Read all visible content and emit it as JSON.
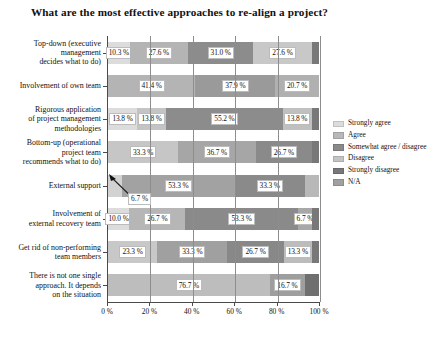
{
  "chart_data": {
    "type": "bar",
    "subtype": "stacked-horizontal-100",
    "title": "What are the most effective approaches to re-align a project?",
    "xlabel": "",
    "ylabel": "",
    "xlim": [
      0,
      100
    ],
    "grid": true,
    "legend_position": "right",
    "xticks": [
      "0 %",
      "20 %",
      "40 %",
      "60 %",
      "80 %",
      "100 %"
    ],
    "xtick_values": [
      0,
      20,
      40,
      60,
      80,
      100
    ],
    "categories": [
      "Top-down (executive management decides what to do)",
      "Involvement of own team",
      "Rigorous application of project management methodologies",
      "Bottom-up (operational project team recommends what to do)",
      "External support",
      "Involvement of external recovery team",
      "Get rid of non-performing team members",
      "There is not one single approach. It depends on the situation"
    ],
    "series": [
      {
        "name": "Strongly agree",
        "color": "#dcdcdc",
        "values": [
          10.3,
          41.4,
          13.8,
          33.3,
          6.7,
          10.0,
          23.3,
          76.7
        ]
      },
      {
        "name": "Agree",
        "color": "#b4b4b4",
        "values": [
          27.6,
          37.9,
          13.8,
          36.7,
          53.3,
          26.7,
          33.3,
          0
        ]
      },
      {
        "name": "Somewhat agree / disagree",
        "color": "#8c8c8c",
        "values": [
          31.0,
          20.7,
          55.2,
          26.7,
          33.3,
          53.3,
          26.7,
          16.7
        ]
      },
      {
        "name": "Disagree",
        "color": "#c8c8c8",
        "values": [
          27.6,
          0,
          13.8,
          0,
          0,
          6.7,
          13.3,
          0
        ]
      },
      {
        "name": "Strongly disagree",
        "color": "#787878",
        "values": [
          3.5,
          0,
          3.4,
          3.3,
          6.7,
          3.3,
          3.4,
          6.6
        ]
      },
      {
        "name": "N/A",
        "color": "#a0a0a0",
        "values": [
          0,
          0,
          0,
          0,
          0,
          0,
          0,
          0
        ]
      }
    ],
    "rows": [
      {
        "category_lines": [
          "Top-down (executive",
          "management",
          "decides what to do)"
        ],
        "segments": [
          {
            "series": "Strongly agree",
            "value": 10.3,
            "label": "10.3 %",
            "color": "#dcdcdc",
            "show_label": true
          },
          {
            "series": "Agree",
            "value": 27.6,
            "label": "27.6 %",
            "color": "#b4b4b4",
            "show_label": true
          },
          {
            "series": "Somewhat agree / disagree",
            "value": 31.0,
            "label": "31.0 %",
            "color": "#8c8c8c",
            "show_label": true
          },
          {
            "series": "Disagree",
            "value": 27.6,
            "label": "27.6 %",
            "color": "#c8c8c8",
            "show_label": true
          },
          {
            "series": "Strongly disagree",
            "value": 3.5,
            "label": "",
            "color": "#787878",
            "show_label": false
          }
        ]
      },
      {
        "category_lines": [
          "Involvement of own team"
        ],
        "segments": [
          {
            "series": "Strongly agree",
            "value": 41.4,
            "label": "41.4 %",
            "color": "#b4b4b4",
            "show_label": true
          },
          {
            "series": "Agree",
            "value": 37.9,
            "label": "37.9 %",
            "color": "#9a9a9a",
            "show_label": true
          },
          {
            "series": "Somewhat agree / disagree",
            "value": 20.7,
            "label": "20.7 %",
            "color": "#b0b0b0",
            "show_label": true
          }
        ]
      },
      {
        "category_lines": [
          "Rigorous application",
          "of project management",
          "methodologies"
        ],
        "segments": [
          {
            "series": "Strongly agree",
            "value": 13.8,
            "label": "13.8 %",
            "color": "#dcdcdc",
            "show_label": true
          },
          {
            "series": "Agree",
            "value": 13.8,
            "label": "13.8 %",
            "color": "#c4c4c4",
            "show_label": true
          },
          {
            "series": "Somewhat agree / disagree",
            "value": 55.2,
            "label": "55.2 %",
            "color": "#8c8c8c",
            "show_label": true
          },
          {
            "series": "Disagree",
            "value": 13.8,
            "label": "13.8 %",
            "color": "#c0c0c0",
            "show_label": true
          },
          {
            "series": "Strongly disagree",
            "value": 3.4,
            "label": "",
            "color": "#787878",
            "show_label": false
          }
        ]
      },
      {
        "category_lines": [
          "Bottom-up (operational",
          "project team",
          "recommends what to do)"
        ],
        "segments": [
          {
            "series": "Strongly agree",
            "value": 33.3,
            "label": "33.3 %",
            "color": "#c6c6c6",
            "show_label": true
          },
          {
            "series": "Agree",
            "value": 36.7,
            "label": "36.7 %",
            "color": "#a6a6a6",
            "show_label": true
          },
          {
            "series": "Somewhat agree / disagree",
            "value": 26.7,
            "label": "26.7 %",
            "color": "#8a8a8a",
            "show_label": true
          },
          {
            "series": "Strongly disagree",
            "value": 3.3,
            "label": "",
            "color": "#787878",
            "show_label": false
          }
        ]
      },
      {
        "category_lines": [
          "External support"
        ],
        "segments": [
          {
            "series": "Strongly agree",
            "value": 6.7,
            "label": "6.7 %",
            "color": "#d2d2d2",
            "show_label": false
          },
          {
            "series": "Agree",
            "value": 53.3,
            "label": "53.3 %",
            "color": "#a2a2a2",
            "show_label": true
          },
          {
            "series": "Somewhat agree / disagree",
            "value": 33.3,
            "label": "33.3 %",
            "color": "#8a8a8a",
            "show_label": true
          },
          {
            "series": "Strongly disagree",
            "value": 6.7,
            "label": "",
            "color": "#b8b8b8",
            "show_label": false
          }
        ]
      },
      {
        "category_lines": [
          "Involvement of",
          "external recovery team"
        ],
        "segments": [
          {
            "series": "Strongly agree",
            "value": 10.0,
            "label": "10.0 %",
            "color": "#dcdcdc",
            "show_label": true
          },
          {
            "series": "Agree",
            "value": 26.7,
            "label": "26.7 %",
            "color": "#b6b6b6",
            "show_label": true
          },
          {
            "series": "Somewhat agree / disagree",
            "value": 53.3,
            "label": "53.3 %",
            "color": "#8a8a8a",
            "show_label": true
          },
          {
            "series": "Disagree",
            "value": 6.7,
            "label": "6.7 %",
            "color": "#a8a8a8",
            "show_label": true
          },
          {
            "series": "Strongly disagree",
            "value": 3.3,
            "label": "",
            "color": "#787878",
            "show_label": false
          }
        ]
      },
      {
        "category_lines": [
          "Get rid of non-performing",
          "team members"
        ],
        "segments": [
          {
            "series": "Strongly agree",
            "value": 23.3,
            "label": "23.3 %",
            "color": "#c8c8c8",
            "show_label": true
          },
          {
            "series": "Agree",
            "value": 33.3,
            "label": "33.3 %",
            "color": "#a0a0a0",
            "show_label": true
          },
          {
            "series": "Somewhat agree / disagree",
            "value": 26.7,
            "label": "26.7 %",
            "color": "#888888",
            "show_label": true
          },
          {
            "series": "Disagree",
            "value": 13.3,
            "label": "13.3 %",
            "color": "#bcbcbc",
            "show_label": true
          },
          {
            "series": "Strongly disagree",
            "value": 3.4,
            "label": "",
            "color": "#787878",
            "show_label": false
          }
        ]
      },
      {
        "category_lines": [
          "There is not one single",
          "approach.  It depends",
          "on the situation"
        ],
        "segments": [
          {
            "series": "Strongly agree",
            "value": 76.7,
            "label": "76.7 %",
            "color": "#bdbdbd",
            "show_label": true
          },
          {
            "series": "Somewhat agree / disagree",
            "value": 16.7,
            "label": "16.7 %",
            "color": "#9e9e9e",
            "show_label": true
          },
          {
            "series": "Strongly disagree",
            "value": 6.6,
            "label": "",
            "color": "#6f6f6f",
            "show_label": false
          }
        ]
      }
    ],
    "callout": {
      "label": "6.7 %",
      "points_to_row": "External support",
      "points_to_series": "Strongly agree"
    },
    "legend": [
      {
        "label": "Strongly agree",
        "color": "#dcdcdc"
      },
      {
        "label": "Agree",
        "color": "#b8b8b8"
      },
      {
        "label": "Somewhat agree / disagree",
        "color": "#8a8a8a"
      },
      {
        "label": "Disagree",
        "color": "#c4c4c4"
      },
      {
        "label": "Strongly disagree",
        "color": "#787878"
      },
      {
        "label": "N/A",
        "color": "#a0a0a0"
      }
    ]
  }
}
